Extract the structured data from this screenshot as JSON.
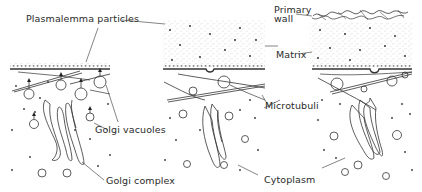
{
  "figure": {
    "type": "diagram",
    "panels": [
      {
        "id": "panel-1",
        "description": "plasmalemma with particles, golgi vacuoles fusing"
      },
      {
        "id": "panel-2",
        "description": "matrix deposited above plasmalemma"
      },
      {
        "id": "panel-3",
        "description": "primary wall formed above matrix"
      }
    ]
  },
  "labels": {
    "plasmalemma_particles": "Plasmalemma particles",
    "primary_wall_line1": "Primary",
    "primary_wall_line2": "wall",
    "matrix": "Matrix",
    "golgi_vacuoles": "Golgi  vacuoles",
    "microtubuli": "Microtubuli",
    "golgi_complex": "Golgi  complex",
    "cytoplasm": "Cytoplasm"
  },
  "colors": {
    "ink": "#333333",
    "background": "#ffffff"
  }
}
